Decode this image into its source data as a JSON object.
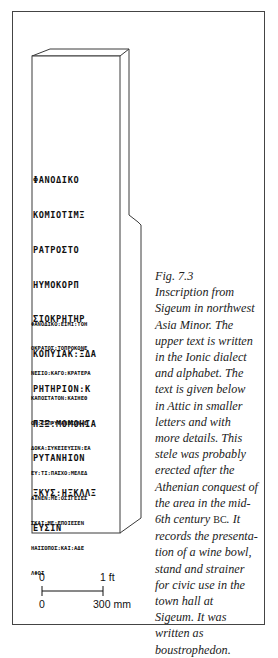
{
  "figure": {
    "number": "Fig. 7.3",
    "caption_lines": [
      "Inscription from",
      "Sigeum in northwest",
      "Asia Minor. The",
      "upper text is written",
      "in the Ionic dialect",
      "and alphabet. The",
      "text is given below",
      "in Attic in smaller",
      "letters and with",
      "more details. This",
      "stele was probably",
      "erected after the",
      "Athenian conquest of",
      "the area in the mid-"
    ],
    "caption_line_bc_prefix": "6th century ",
    "caption_line_bc": "BC",
    "caption_line_bc_suffix": ". It",
    "caption_lines_end": [
      "records the presenta-",
      "tion of a wine bowl,",
      "stand and strainer",
      "for civic use in the",
      "town hall at",
      "Sigeum. It was",
      "written as",
      "boustrophedon."
    ]
  },
  "inscription": {
    "upper_lines": [
      "ΦΑΝΟΔΙΚΟ",
      "ΚΟΜΙΟΤΙΜΞ",
      "ΡΑΤΡΟΣΤΟ",
      "ΗΥΜΟΚΟΡΠ",
      "ΣΙΟΚΡΗΤΗΡ",
      "ΚΟΠΥΙΑΚ:ΞΔΑ",
      "ΡΗΤΗΡΙΟΝ:Κ",
      "ΠΞΞ:ΜΟΜΟΗΙΑ",
      "ΡΥΤΑΝΗΙΟΝ",
      "ΞΚΥΣ:ΗΞΚΛΛΞ",
      "ΕΥΣΙΝ"
    ],
    "lower_lines": [
      "ΦΑΝΟΔΙΚΟ:ΕΙΜΙ:ΤΟΗ",
      "ΟΚΡΑΤΟΣ:ΤΟΠΡΟΚΟΝΕ",
      "ΝΕΣΙΟ:ΚΑΓΟ:ΚΡΑΤΕΡΑ",
      "ΚΑΠΟΣΤΑΤΟΝ:ΚΑΙΗΕΘ",
      "ΟΝ:ΕΣΠΡΥΤΑΝΕΙΟΝ:Ε",
      "ΔΟΚΑ:ΣΥΚΕΙΕΥΣΙΝ:ΕΑ",
      "ΕΥ:ΤΙ:ΠΑΣΧΟ:ΜΕΛΕΔ",
      "ΑΙΝΕΝ:ΜΕ:ΟΣΙΓΕΙΕΣ",
      "ΣΚΑΙ:ΜΕ:ΕΠΟΙΕΣΕΝ",
      "ΗΑΙΣΟΠΟΣ:ΚΑΙ:ΑΔΕ",
      "ΛΦΟΙ"
    ]
  },
  "scale_bar": {
    "imperial_start": "0",
    "imperial_end": "1 ft",
    "metric_start": "0",
    "metric_end": "300 mm"
  },
  "colors": {
    "line": "#3a3a3a",
    "text": "#222222",
    "background": "#ffffff"
  }
}
